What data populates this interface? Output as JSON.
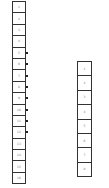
{
  "diagram": {
    "left_stack": {
      "cells": [
        {
          "label": "1",
          "tick": false
        },
        {
          "label": "2",
          "tick": false
        },
        {
          "label": "3",
          "tick": false
        },
        {
          "label": "4",
          "tick": false
        },
        {
          "label": "5",
          "tick": true
        },
        {
          "label": "6",
          "tick": true
        },
        {
          "label": "7",
          "tick": true
        },
        {
          "label": "8",
          "tick": true
        },
        {
          "label": "9",
          "tick": true
        },
        {
          "label": "10",
          "tick": true
        },
        {
          "label": "11",
          "tick": true
        },
        {
          "label": "12",
          "tick": true
        },
        {
          "label": "13",
          "tick": false
        },
        {
          "label": "14",
          "tick": false
        },
        {
          "label": "15",
          "tick": false
        },
        {
          "label": "16",
          "tick": false
        }
      ]
    },
    "right_stack": {
      "cells": [
        {
          "label": "1"
        },
        {
          "label": "2"
        },
        {
          "label": "3"
        },
        {
          "label": "4"
        },
        {
          "label": "5"
        },
        {
          "label": "6"
        },
        {
          "label": "7"
        },
        {
          "label": "8"
        }
      ]
    },
    "colors": {
      "border": "#333333",
      "tick": "#222222",
      "label": "#777777"
    }
  }
}
